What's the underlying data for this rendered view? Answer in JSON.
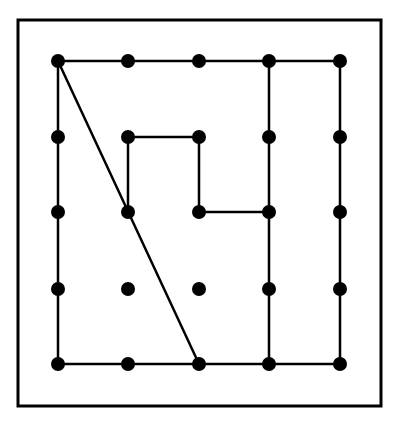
{
  "diagram": {
    "type": "geoboard-grid",
    "colors": {
      "background": "#ffffff",
      "ink": "#000000"
    },
    "frame": {
      "x": 18,
      "y": 20,
      "width": 363,
      "height": 386,
      "stroke_width": 3
    },
    "grid": {
      "cols_x": [
        58,
        128,
        199,
        269,
        340
      ],
      "rows_y": [
        61,
        137,
        212,
        289,
        364
      ],
      "dot_radius": 7
    },
    "edges": [
      [
        [
          0,
          0
        ],
        [
          1,
          0
        ]
      ],
      [
        [
          1,
          0
        ],
        [
          2,
          0
        ]
      ],
      [
        [
          2,
          0
        ],
        [
          3,
          0
        ]
      ],
      [
        [
          3,
          0
        ],
        [
          4,
          0
        ]
      ],
      [
        [
          0,
          0
        ],
        [
          0,
          1
        ]
      ],
      [
        [
          0,
          1
        ],
        [
          0,
          2
        ]
      ],
      [
        [
          0,
          2
        ],
        [
          0,
          3
        ]
      ],
      [
        [
          0,
          3
        ],
        [
          0,
          4
        ]
      ],
      [
        [
          0,
          4
        ],
        [
          1,
          4
        ]
      ],
      [
        [
          1,
          4
        ],
        [
          2,
          4
        ]
      ],
      [
        [
          2,
          4
        ],
        [
          3,
          4
        ]
      ],
      [
        [
          3,
          4
        ],
        [
          4,
          4
        ]
      ],
      [
        [
          4,
          0
        ],
        [
          4,
          1
        ]
      ],
      [
        [
          4,
          1
        ],
        [
          4,
          2
        ]
      ],
      [
        [
          4,
          2
        ],
        [
          4,
          3
        ]
      ],
      [
        [
          4,
          3
        ],
        [
          4,
          4
        ]
      ],
      [
        [
          3,
          0
        ],
        [
          3,
          1
        ]
      ],
      [
        [
          3,
          1
        ],
        [
          3,
          2
        ]
      ],
      [
        [
          3,
          2
        ],
        [
          3,
          3
        ]
      ],
      [
        [
          3,
          3
        ],
        [
          3,
          4
        ]
      ],
      [
        [
          0,
          0
        ],
        [
          2,
          4
        ]
      ],
      [
        [
          1,
          2
        ],
        [
          1,
          1
        ]
      ],
      [
        [
          1,
          1
        ],
        [
          2,
          1
        ]
      ],
      [
        [
          2,
          1
        ],
        [
          2,
          2
        ]
      ],
      [
        [
          2,
          2
        ],
        [
          3,
          2
        ]
      ]
    ],
    "line_width": 2.5
  }
}
